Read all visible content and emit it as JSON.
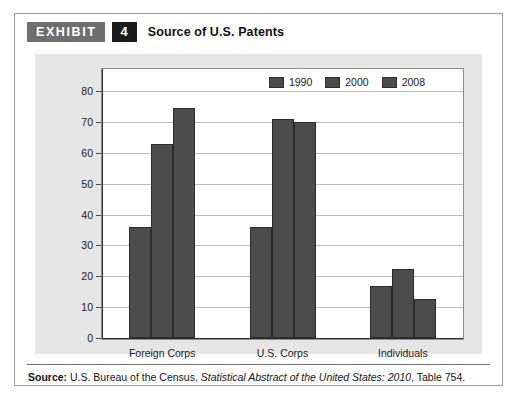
{
  "exhibit": {
    "badge_label": "EXHIBIT",
    "number": "4",
    "title": "Source of U.S. Patents"
  },
  "source": {
    "label": "Source:",
    "text_before": " U.S. Bureau of the Census, ",
    "italic": "Statistical Abstract of the United States: 2010",
    "text_after": ", Table 754."
  },
  "colors": {
    "bar_fill": "#4c4c4c",
    "bar_stroke": "#2b2b2b",
    "panel_bg": "#e6e6e6",
    "plot_bg": "#ffffff",
    "gridline": "#bcbcbc",
    "axis": "#2e2e2e",
    "badge_gray": "#6e6e6e",
    "badge_black": "#1b1b1b"
  },
  "chart_data": {
    "type": "bar",
    "title": "Source of U.S. Patents",
    "xlabel": "",
    "ylabel": "Patents in thousands",
    "ylim": [
      0,
      80
    ],
    "ytick_step": 10,
    "yticks": [
      0,
      10,
      20,
      30,
      40,
      50,
      60,
      70,
      80
    ],
    "ytick_labels": [
      "0",
      "10",
      "20",
      "30",
      "40",
      "50",
      "60",
      "70",
      "80"
    ],
    "grid": true,
    "legend_position": "top-right",
    "categories": [
      "Foreign Corps",
      "U.S. Corps",
      "Individuals"
    ],
    "series": [
      {
        "name": "1990",
        "values": [
          36,
          36,
          17
        ]
      },
      {
        "name": "2000",
        "values": [
          63,
          71,
          22.5
        ]
      },
      {
        "name": "2008",
        "values": [
          74.5,
          70,
          12.5
        ]
      }
    ]
  }
}
